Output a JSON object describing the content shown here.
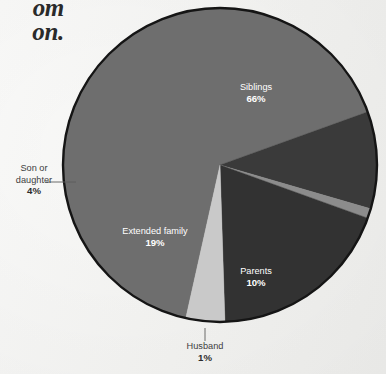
{
  "page": {
    "background_color": "#fbfbfa",
    "headline_fragments": [
      "om",
      "on."
    ]
  },
  "chart_data": {
    "type": "pie",
    "title": "",
    "subtitle": "",
    "xlabel": "",
    "ylabel": "",
    "legend_position": "none",
    "grid": false,
    "value_suffix": "%",
    "total": 100,
    "categories": [
      "Siblings",
      "Parents",
      "Husband",
      "Extended family",
      "Son or daughter"
    ],
    "values": [
      66,
      10,
      1,
      19,
      4
    ],
    "colors": [
      "#6e6e6e",
      "#3a3a3a",
      "#8c8c8c",
      "#323232",
      "#c9c9c9"
    ],
    "slices": [
      {
        "label": "Siblings",
        "value": 66,
        "value_text": "66%",
        "color": "#6e6e6e",
        "label_placement": "inside",
        "label_color": "#ffffff",
        "start_angle_deg": 192.6,
        "end_angle_deg": 430.2,
        "label_x": 256,
        "label_y": 90
      },
      {
        "label": "Parents",
        "value": 10,
        "value_text": "10%",
        "color": "#3a3a3a",
        "label_placement": "inside",
        "label_color": "#ffffff",
        "start_angle_deg": 70.2,
        "end_angle_deg": 106.2,
        "label_x": 256,
        "label_y": 274
      },
      {
        "label": "Husband",
        "value": 1,
        "value_text": "1%",
        "color": "#8c8c8c",
        "label_placement": "outside",
        "label_color": "#3d3d3d",
        "start_angle_deg": 106.2,
        "end_angle_deg": 109.8,
        "label_x": 205,
        "label_y": 349,
        "leader": {
          "x1": 205,
          "y1": 328,
          "x2": 205,
          "y2": 341
        }
      },
      {
        "label": "Extended family",
        "value": 19,
        "value_text": "19%",
        "color": "#323232",
        "label_placement": "inside",
        "label_color": "#ffffff",
        "start_angle_deg": 109.8,
        "end_angle_deg": 178.2,
        "label_x": 155,
        "label_y": 234
      },
      {
        "label": "Son or daughter",
        "value": 4,
        "value_text": "4%",
        "color": "#c9c9c9",
        "label_placement": "outside",
        "label_color": "#3d3d3d",
        "label_lines": [
          "Son or",
          "daughter"
        ],
        "start_angle_deg": 178.2,
        "end_angle_deg": 192.6,
        "label_x": 34,
        "label_y": 171,
        "leader": {
          "x1": 76,
          "y1": 182,
          "x2": 46,
          "y2": 182
        }
      }
    ],
    "geometry": {
      "center_x": 220,
      "center_y": 165,
      "radius": 157,
      "outline_color": "#151515",
      "outline_width": 2.4
    }
  }
}
